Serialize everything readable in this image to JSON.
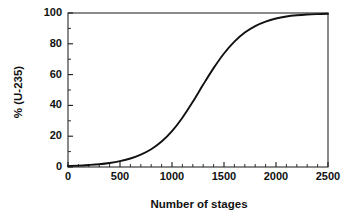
{
  "chart_data": {
    "type": "line",
    "title": "",
    "subtitle": "",
    "xlabel": "Number of stages",
    "ylabel": "% (U-235)",
    "xlim": [
      0,
      2500
    ],
    "ylim": [
      0,
      100
    ],
    "grid": false,
    "legend": null,
    "legend_position": "none",
    "x_ticks": [
      0,
      500,
      1000,
      1500,
      2000,
      2500
    ],
    "x_tick_labels": [
      "0",
      "500",
      "1000",
      "1500",
      "2000",
      "2500"
    ],
    "x_minor_interval": 100,
    "y_ticks": [
      0,
      20,
      40,
      60,
      80,
      100
    ],
    "y_tick_labels": [
      "0",
      "20",
      "40",
      "60",
      "80",
      "100"
    ],
    "y_minor_interval": 10,
    "line_color": "#111111",
    "frame_color": "#2b2b2b",
    "background_color": "#ffffff",
    "series": [
      {
        "name": "U-235 enrichment",
        "x": [
          0,
          100,
          200,
          300,
          400,
          500,
          600,
          700,
          800,
          900,
          1000,
          1100,
          1200,
          1300,
          1400,
          1500,
          1600,
          1700,
          1800,
          1900,
          2000,
          2100,
          2200,
          2300,
          2400,
          2500
        ],
        "values": [
          0.7,
          0.9,
          1.3,
          1.8,
          2.6,
          3.8,
          5.5,
          8.0,
          11.5,
          16.5,
          23.3,
          32.0,
          42.3,
          53.5,
          64.2,
          73.7,
          81.4,
          87.3,
          91.5,
          94.4,
          96.4,
          97.7,
          98.5,
          99.0,
          99.3,
          99.5
        ]
      }
    ],
    "annotations": []
  },
  "axis": {
    "x_title": "Number of stages",
    "y_title": "% (U-235)"
  }
}
